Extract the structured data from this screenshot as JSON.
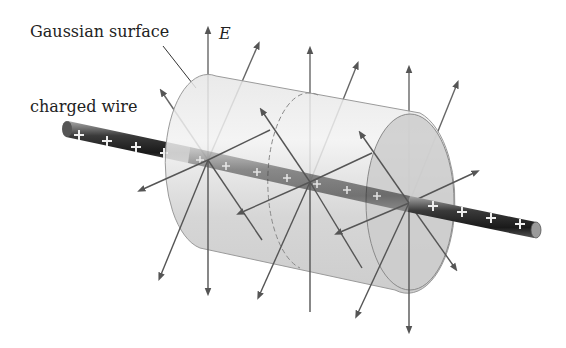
{
  "figure": {
    "labels": {
      "gaussian_surface": "Gaussian surface",
      "charged_wire": "charged wire",
      "field": "E"
    },
    "charge_symbol": "+",
    "colors": {
      "wire_dark": "#2a2a2a",
      "wire_light": "#9a9a9a",
      "cylinder_fill": "#d4d4d4",
      "cylinder_edge": "#8a8a8a",
      "field_line": "#555555",
      "text": "#222222"
    },
    "plus_signs_outside_left": 4,
    "plus_signs_inside": 7,
    "plus_signs_outside_right": 4
  }
}
